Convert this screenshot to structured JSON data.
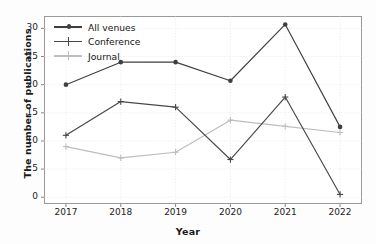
{
  "chart_data": {
    "type": "line",
    "title": "",
    "xlabel": "Year",
    "ylabel": "The number of publications",
    "categories": [
      "2017",
      "2018",
      "2019",
      "2020",
      "2021",
      "2022"
    ],
    "x": [
      2017,
      2018,
      2019,
      2020,
      2021,
      2022
    ],
    "xlim": [
      2016.6,
      2022.4
    ],
    "ylim": [
      -1.2,
      32.2
    ],
    "yticks": [
      0,
      5,
      10,
      15,
      20,
      25,
      30
    ],
    "xticks": [
      "2017",
      "2018",
      "2019",
      "2020",
      "2021",
      "2022"
    ],
    "grid": true,
    "legend_position": "upper left",
    "series": [
      {
        "name": "All venues",
        "values": [
          20,
          24,
          24,
          20.7,
          30.7,
          12.5
        ],
        "color": "#3f3f3f",
        "marker": "circle"
      },
      {
        "name": "Conference",
        "values": [
          11,
          17,
          16,
          6.7,
          17.8,
          0.5
        ],
        "color": "#474747",
        "marker": "plus"
      },
      {
        "name": "Journal",
        "values": [
          9,
          7,
          8,
          13.7,
          12.6,
          11.5
        ],
        "color": "#bdbdbd",
        "marker": "plus"
      }
    ]
  },
  "axis": {
    "y_tick_labels": [
      "0",
      "5",
      "10",
      "15",
      "20",
      "25",
      "30"
    ],
    "x_tick_labels": [
      "2017",
      "2018",
      "2019",
      "2020",
      "2021",
      "2022"
    ],
    "y_title": "The number of publications",
    "x_title": "Year"
  },
  "legend": {
    "items": [
      {
        "label": "All venues"
      },
      {
        "label": "Conference"
      },
      {
        "label": "Journal"
      }
    ]
  }
}
